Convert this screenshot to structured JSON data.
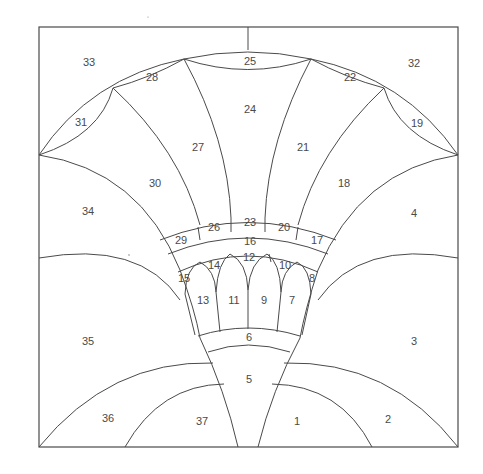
{
  "diagram": {
    "type": "stained-glass pattern",
    "line_color": "#4a4a4a",
    "background": "#ffffff",
    "pieces": [
      {
        "id": "1",
        "label": "1"
      },
      {
        "id": "2",
        "label": "2"
      },
      {
        "id": "3",
        "label": "3"
      },
      {
        "id": "4",
        "label": "4"
      },
      {
        "id": "5",
        "label": "5"
      },
      {
        "id": "6",
        "label": "6"
      },
      {
        "id": "7",
        "label": "7"
      },
      {
        "id": "8",
        "label": "8"
      },
      {
        "id": "9",
        "label": "9"
      },
      {
        "id": "10",
        "label": "10"
      },
      {
        "id": "11",
        "label": "11"
      },
      {
        "id": "12",
        "label": "12"
      },
      {
        "id": "13",
        "label": "13"
      },
      {
        "id": "14",
        "label": "14"
      },
      {
        "id": "15",
        "label": "15"
      },
      {
        "id": "16",
        "label": "16"
      },
      {
        "id": "17",
        "label": "17"
      },
      {
        "id": "18",
        "label": "18"
      },
      {
        "id": "19",
        "label": "19"
      },
      {
        "id": "20",
        "label": "20"
      },
      {
        "id": "21",
        "label": "21"
      },
      {
        "id": "22",
        "label": "22"
      },
      {
        "id": "23",
        "label": "23"
      },
      {
        "id": "24",
        "label": "24"
      },
      {
        "id": "25",
        "label": "25"
      },
      {
        "id": "26",
        "label": "26"
      },
      {
        "id": "27",
        "label": "27"
      },
      {
        "id": "28",
        "label": "28"
      },
      {
        "id": "29",
        "label": "29"
      },
      {
        "id": "30",
        "label": "30"
      },
      {
        "id": "31",
        "label": "31"
      },
      {
        "id": "32",
        "label": "32"
      },
      {
        "id": "33",
        "label": "33"
      },
      {
        "id": "34",
        "label": "34"
      },
      {
        "id": "35",
        "label": "35"
      },
      {
        "id": "36",
        "label": "36"
      },
      {
        "id": "37",
        "label": "37"
      }
    ]
  }
}
